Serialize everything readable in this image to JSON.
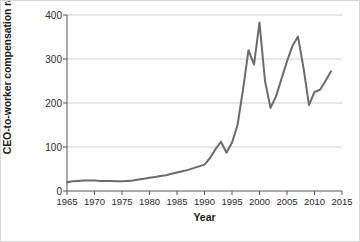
{
  "chart_data": {
    "type": "line",
    "title": "",
    "xlabel": "Year",
    "ylabel": "CEO-to-worker compensation ratio",
    "xlim": [
      1965,
      2015
    ],
    "ylim": [
      0,
      400
    ],
    "xticks": [
      1965,
      1970,
      1975,
      1980,
      1985,
      1990,
      1995,
      2000,
      2005,
      2010,
      2015
    ],
    "xtick_labels": [
      "1965",
      "1970",
      "1975",
      "1980",
      "1985",
      "1990",
      "1995",
      "2000",
      "2005",
      "2010",
      "2015"
    ],
    "yticks": [
      0,
      100,
      200,
      300,
      400
    ],
    "ytick_labels": [
      "0",
      "100",
      "200",
      "300",
      "400"
    ],
    "grid": "horizontal",
    "grid_color": "#cfcfcf",
    "legend": "none",
    "line_color": "#6b6b6b",
    "line_width": 2,
    "series": [
      {
        "name": "CEO-to-worker compensation ratio",
        "x": [
          1965,
          1966,
          1967,
          1968,
          1969,
          1970,
          1971,
          1972,
          1973,
          1974,
          1975,
          1976,
          1977,
          1978,
          1979,
          1980,
          1981,
          1982,
          1983,
          1984,
          1985,
          1986,
          1987,
          1988,
          1989,
          1990,
          1991,
          1992,
          1993,
          1994,
          1995,
          1996,
          1997,
          1998,
          1999,
          2000,
          2001,
          2002,
          2003,
          2004,
          2005,
          2006,
          2007,
          2008,
          2009,
          2010,
          2011,
          2012,
          2013
        ],
        "values": [
          20,
          22,
          23,
          24,
          24,
          24,
          23,
          23,
          23,
          22,
          22,
          23,
          24,
          26,
          28,
          30,
          32,
          34,
          36,
          39,
          42,
          45,
          48,
          52,
          56,
          60,
          75,
          95,
          112,
          87,
          110,
          150,
          230,
          320,
          287,
          383,
          250,
          189,
          215,
          255,
          295,
          330,
          351,
          280,
          195,
          225,
          230,
          250,
          272
        ]
      }
    ],
    "annotations": []
  },
  "axes": {
    "y_title": "CEO-to-worker compensation ratio",
    "x_title": "Year"
  }
}
